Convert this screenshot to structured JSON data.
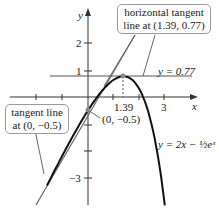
{
  "chart_data": {
    "type": "line",
    "title": "",
    "xlabel": "x",
    "ylabel": "y",
    "x_ticks": [
      "-2",
      "1.39",
      "3"
    ],
    "y_ticks": [
      "1",
      "2",
      "-3"
    ],
    "xlim": [
      -3,
      4.5
    ],
    "ylim": [
      -4,
      3.5
    ],
    "series": [
      {
        "name": "y = 2x - 1/2 e^x",
        "formula": "2x - 0.5*exp(x)"
      },
      {
        "name": "tangent line at (0, -0.5)",
        "formula": "1.5x - 0.5"
      },
      {
        "name": "y = 0.77",
        "formula": "0.77"
      }
    ],
    "points": [
      {
        "x": 0,
        "y": -0.5,
        "label": "(0, −0.5)"
      },
      {
        "x": 1.39,
        "y": 0.77
      }
    ],
    "annotations": [
      "horizontal tangent line at (1.39, 0.77)",
      "tangent line at (0, −0.5)",
      "y = 0.77"
    ]
  },
  "labels": {
    "x_axis": "x",
    "y_axis": "y",
    "tick_neg2": "−2",
    "tick_139": "1.39",
    "tick_3": "3",
    "tick_y1": "1",
    "tick_y2": "2",
    "tick_yneg3": "−3",
    "hline": "y = 0.77",
    "point0": "(0, −0.5)",
    "callout_top_1": "horizontal tangent",
    "callout_top_2": "line at (1.39, 0.77)",
    "callout_left_1": "tangent line",
    "callout_left_2": "at (0, −0.5)",
    "func": "y = 2x − ½eˣ"
  }
}
